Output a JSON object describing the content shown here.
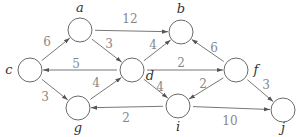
{
  "diagram": {
    "type": "weighted-directed-graph",
    "node_radius": 12,
    "colors": {
      "edge": "#777777",
      "node_stroke": "#6a6a6a",
      "node_label": "#333333",
      "edge_label": "#888888"
    },
    "nodes": [
      {
        "id": "a",
        "label": "a",
        "x": 80,
        "y": 30,
        "lx": 80,
        "ly": 12
      },
      {
        "id": "b",
        "label": "b",
        "x": 181,
        "y": 32,
        "lx": 181,
        "ly": 13
      },
      {
        "id": "c",
        "label": "c",
        "x": 30,
        "y": 70,
        "lx": 9,
        "ly": 74
      },
      {
        "id": "d",
        "label": "d",
        "x": 132,
        "y": 70,
        "lx": 150,
        "ly": 80
      },
      {
        "id": "f",
        "label": "f",
        "x": 236,
        "y": 70,
        "lx": 256,
        "ly": 74
      },
      {
        "id": "g",
        "label": "g",
        "x": 78,
        "y": 108,
        "lx": 78,
        "ly": 132
      },
      {
        "id": "i",
        "label": "i",
        "x": 178,
        "y": 106,
        "lx": 178,
        "ly": 131
      },
      {
        "id": "j",
        "label": "j",
        "x": 283,
        "y": 110,
        "lx": 283,
        "ly": 132
      }
    ],
    "edges": [
      {
        "from": "c",
        "to": "a",
        "weight": "6",
        "lx": 47,
        "ly": 46
      },
      {
        "from": "a",
        "to": "b",
        "weight": "12",
        "lx": 130,
        "ly": 23
      },
      {
        "from": "a",
        "to": "d",
        "weight": "3",
        "lx": 109,
        "ly": 48
      },
      {
        "from": "d",
        "to": "c",
        "weight": "5",
        "lx": 76,
        "ly": 68
      },
      {
        "from": "d",
        "to": "b",
        "weight": "4",
        "lx": 153,
        "ly": 49
      },
      {
        "from": "f",
        "to": "b",
        "weight": "6",
        "lx": 214,
        "ly": 52
      },
      {
        "from": "d",
        "to": "f",
        "weight": "2",
        "lx": 181,
        "ly": 67
      },
      {
        "from": "c",
        "to": "g",
        "weight": "3",
        "lx": 45,
        "ly": 101
      },
      {
        "from": "g",
        "to": "d",
        "weight": "4",
        "lx": 96,
        "ly": 87
      },
      {
        "from": "d",
        "to": "i",
        "weight": "4",
        "lx": 160,
        "ly": 91
      },
      {
        "from": "f",
        "to": "i",
        "weight": "2",
        "lx": 203,
        "ly": 88
      },
      {
        "from": "i",
        "to": "g",
        "weight": "2",
        "lx": 126,
        "ly": 122
      },
      {
        "from": "i",
        "to": "j",
        "weight": "10",
        "lx": 230,
        "ly": 125
      },
      {
        "from": "f",
        "to": "j",
        "weight": "3",
        "lx": 266,
        "ly": 89
      }
    ]
  }
}
